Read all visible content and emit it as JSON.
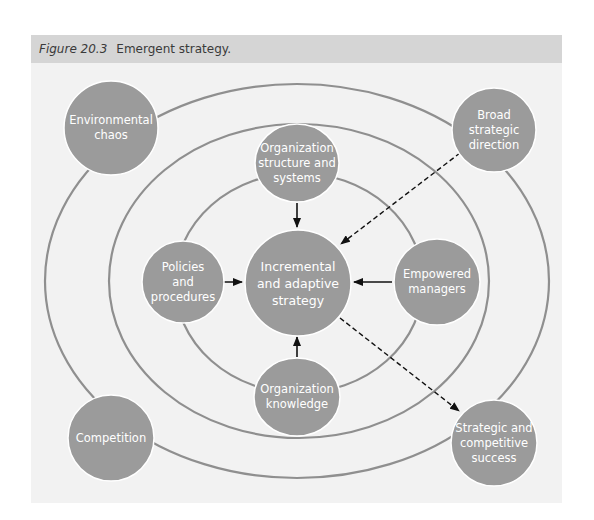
{
  "figure": {
    "label": "Figure 20.3",
    "caption": "Emergent strategy."
  },
  "colors": {
    "header_bg": "#d5d5d5",
    "figure_bg": "#f2f2f2",
    "node_fill": "#9b9b9b",
    "ring_stroke": "#8f8f8f",
    "arrow": "#111111"
  },
  "nodes": {
    "environmental_chaos": {
      "label": "Environmental\nchaos"
    },
    "broad_strategic_direction": {
      "label": "Broad\nstrategic\ndirection"
    },
    "organization_structure": {
      "label": "Organization\nstructure and\nsystems"
    },
    "policies_procedures": {
      "label": "Policies\nand\nprocedures"
    },
    "incremental_strategy": {
      "label": "Incremental\nand adaptive\nstrategy"
    },
    "empowered_managers": {
      "label": "Empowered\nmanagers"
    },
    "organization_knowledge": {
      "label": "Organization\nknowledge"
    },
    "competition": {
      "label": "Competition"
    },
    "strategic_success": {
      "label": "Strategic and\ncompetitive\nsuccess"
    }
  },
  "edges": [
    {
      "from": "Organization structure and systems",
      "to": "Incremental and adaptive strategy",
      "style": "solid"
    },
    {
      "from": "Policies and procedures",
      "to": "Incremental and adaptive strategy",
      "style": "solid"
    },
    {
      "from": "Empowered managers",
      "to": "Incremental and adaptive strategy",
      "style": "solid"
    },
    {
      "from": "Organization knowledge",
      "to": "Incremental and adaptive strategy",
      "style": "solid"
    },
    {
      "from": "Broad strategic direction",
      "to": "Incremental and adaptive strategy",
      "style": "dashed"
    },
    {
      "from": "Incremental and adaptive strategy",
      "to": "Strategic and competitive success",
      "style": "dashed"
    }
  ],
  "rings": [
    {
      "name": "outer",
      "cx": 297,
      "cy": 281,
      "rx": 252,
      "ry": 197
    },
    {
      "name": "middle",
      "cx": 299,
      "cy": 281,
      "rx": 190,
      "ry": 157
    },
    {
      "name": "inner",
      "cx": 299,
      "cy": 283,
      "rx": 124,
      "ry": 110
    }
  ]
}
